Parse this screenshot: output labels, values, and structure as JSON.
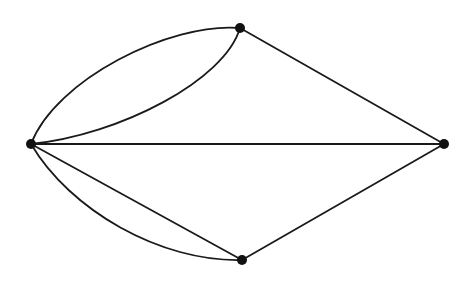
{
  "diagram": {
    "type": "multigraph",
    "stroke_color": "#1a1a1a",
    "node_color": "#111111",
    "nodes": [
      {
        "id": "left",
        "x": 31,
        "y": 144,
        "r": 5
      },
      {
        "id": "top",
        "x": 240,
        "y": 28,
        "r": 5
      },
      {
        "id": "right",
        "x": 444,
        "y": 144,
        "r": 5
      },
      {
        "id": "bottom",
        "x": 242,
        "y": 260,
        "r": 5
      }
    ],
    "edges": [
      {
        "id": "left-top-outer",
        "from": "left",
        "to": "top",
        "path": "M31,144 C55,80 170,22 240,28"
      },
      {
        "id": "left-top-inner",
        "from": "left",
        "to": "top",
        "path": "M31,144 C120,135 225,80 240,28"
      },
      {
        "id": "left-right",
        "from": "left",
        "to": "right",
        "path": "M31,144 L444,144"
      },
      {
        "id": "top-right",
        "from": "top",
        "to": "right",
        "path": "M240,28 L444,144"
      },
      {
        "id": "left-bottom-straight",
        "from": "left",
        "to": "bottom",
        "path": "M31,144 L242,260"
      },
      {
        "id": "left-bottom-curved",
        "from": "left",
        "to": "bottom",
        "path": "M31,144 C70,210 160,262 242,260"
      },
      {
        "id": "bottom-right",
        "from": "bottom",
        "to": "right",
        "path": "M242,260 L444,144"
      }
    ]
  }
}
